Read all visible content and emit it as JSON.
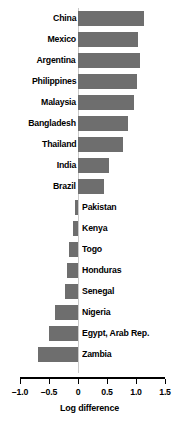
{
  "chart_data": {
    "type": "bar",
    "orientation": "horizontal",
    "title": "",
    "xlabel": "Log difference",
    "ylabel": "",
    "xlim": [
      -1.0,
      1.5
    ],
    "xticks": [
      -1.0,
      -0.5,
      0,
      0.5,
      1.0,
      1.5
    ],
    "xticklabels": [
      "–1.0",
      "–0.5",
      "0",
      "0.5",
      "1.0",
      "1.5"
    ],
    "grid": false,
    "legend": null,
    "bar_color": "#6e6e6e",
    "zero_line_color": "#c9c9c9",
    "categories": [
      "China",
      "Mexico",
      "Argentina",
      "Philippines",
      "Malaysia",
      "Bangladesh",
      "Thailand",
      "India",
      "Brazil",
      "Pakistan",
      "Kenya",
      "Togo",
      "Honduras",
      "Senegal",
      "Nigeria",
      "Egypt, Arab Rep.",
      "Zambia"
    ],
    "values": [
      1.14,
      1.03,
      1.07,
      1.02,
      0.97,
      0.86,
      0.78,
      0.53,
      0.45,
      -0.05,
      -0.09,
      -0.16,
      -0.19,
      -0.22,
      -0.4,
      -0.5,
      -0.69
    ]
  }
}
